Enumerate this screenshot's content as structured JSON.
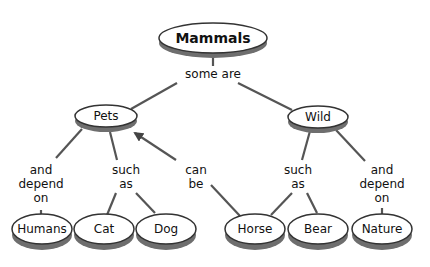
{
  "diagram": {
    "type": "concept-map",
    "colors": {
      "line": "#555555",
      "shadow": "#6e6e6e",
      "fill": "#ffffff",
      "stroke": "#333333",
      "text": "#111111"
    },
    "nodes": {
      "mammals": {
        "label": "Mammals"
      },
      "pets": {
        "label": "Pets"
      },
      "wild": {
        "label": "Wild"
      },
      "humans": {
        "label": "Humans"
      },
      "cat": {
        "label": "Cat"
      },
      "dog": {
        "label": "Dog"
      },
      "horse": {
        "label": "Horse"
      },
      "bear": {
        "label": "Bear"
      },
      "nature": {
        "label": "Nature"
      }
    },
    "links": {
      "some_are": {
        "label": "some are"
      },
      "pets_depend": {
        "lines": [
          "and",
          "depend",
          "on"
        ]
      },
      "pets_such": {
        "lines": [
          "such",
          "as"
        ]
      },
      "can_be": {
        "lines": [
          "can",
          "be"
        ]
      },
      "wild_such": {
        "lines": [
          "such",
          "as"
        ]
      },
      "wild_depend": {
        "lines": [
          "and",
          "depend",
          "on"
        ]
      }
    }
  }
}
